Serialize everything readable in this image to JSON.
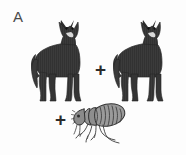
{
  "panel": {
    "label": "A",
    "background_color": "#fdfdfd",
    "width": 186,
    "height": 155
  },
  "operators": {
    "plus_between_wolves": "+",
    "plus_before_flea": "+"
  },
  "organisms": [
    {
      "id": "wolf-left",
      "icon": "wolf-silhouette-icon",
      "common_name": "wolf",
      "count": 1,
      "body_color": "#3b3b3b",
      "outline_color": "#1e1e1e",
      "muzzle_color": "#d9d9d9",
      "pose": "standing, facing viewer"
    },
    {
      "id": "wolf-right",
      "icon": "wolf-silhouette-icon",
      "common_name": "wolf",
      "count": 1,
      "body_color": "#3b3b3b",
      "outline_color": "#1e1e1e",
      "muzzle_color": "#d9d9d9",
      "pose": "standing, facing viewer"
    },
    {
      "id": "flea",
      "icon": "flea-illustration-icon",
      "common_name": "flea",
      "count": 1,
      "body_color": "#8f8f8f",
      "outline_color": "#3c3c3c",
      "stripe_color": "#4a4a4a",
      "pose": "lateral view, facing left"
    }
  ]
}
